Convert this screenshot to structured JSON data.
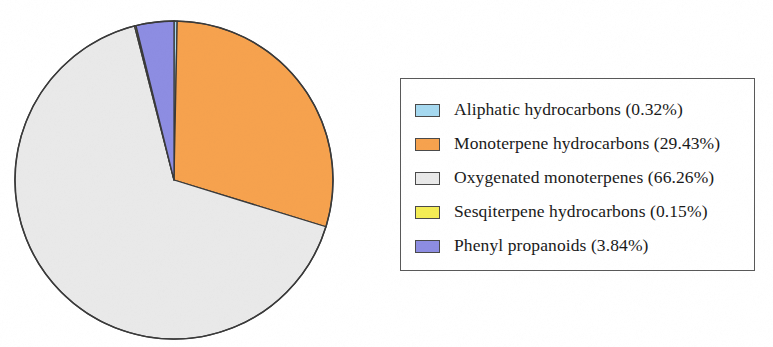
{
  "chart_data": {
    "type": "pie",
    "title": "",
    "subtitle": "",
    "xlabel": "",
    "ylabel": "",
    "grid": false,
    "legend_position": "right",
    "start_angle_deg": 0,
    "direction": "clockwise",
    "units": "%",
    "categories": [
      "Aliphatic hydrocarbons",
      "Monoterpene hydrocarbons",
      "Oxygenated monoterpenes",
      "Sesqiterpene hydrocarbons",
      "Phenyl propanoids"
    ],
    "values": [
      0.32,
      29.43,
      66.26,
      0.15,
      3.84
    ],
    "value_labels": [
      "0.32%",
      "29.43%",
      "66.26%",
      "0.15%",
      "3.84%"
    ],
    "colors": [
      "#A6D9F0",
      "#F6A24E",
      "#E9E9E9",
      "#F4ED55",
      "#8D8DE2"
    ],
    "slice_order_clockwise_from_top": [
      "Aliphatic hydrocarbons",
      "Monoterpene hydrocarbons",
      "Oxygenated monoterpenes",
      "Sesqiterpene hydrocarbons",
      "Phenyl propanoids"
    ],
    "total": 100.0
  },
  "legend": {
    "items": [
      {
        "label": "Aliphatic hydrocarbons (0.32%)",
        "color": "#A6D9F0"
      },
      {
        "label": "Monoterpene hydrocarbons (29.43%)",
        "color": "#F6A24E"
      },
      {
        "label": "Oxygenated monoterpenes (66.26%)",
        "color": "#E9E9E9"
      },
      {
        "label": "Sesqiterpene hydrocarbons (0.15%)",
        "color": "#F4ED55"
      },
      {
        "label": "Phenyl propanoids (3.84%)",
        "color": "#8D8DE2"
      }
    ]
  },
  "pie_geometry": {
    "center_x": 174,
    "center_y": 180,
    "radius": 159,
    "stroke_color": "#3a3a3a"
  }
}
